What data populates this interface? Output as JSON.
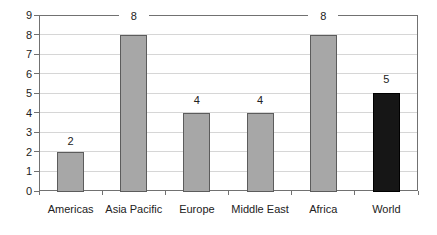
{
  "chart_data": {
    "type": "bar",
    "title": "",
    "xlabel": "",
    "ylabel": "",
    "categories": [
      "Americas",
      "Asia Pacific",
      "Europe",
      "Middle East",
      "Africa",
      "World"
    ],
    "values": [
      2,
      8,
      4,
      4,
      8,
      5
    ],
    "data_labels": [
      "2",
      "8",
      "4",
      "4",
      "8",
      "5"
    ],
    "bar_fills": [
      "#a7a7a7",
      "#a7a7a7",
      "#a7a7a7",
      "#a7a7a7",
      "#a7a7a7",
      "#161616"
    ],
    "bar_borders": [
      "#5c5c5c",
      "#5c5c5c",
      "#5c5c5c",
      "#5c5c5c",
      "#5c5c5c",
      "#000000"
    ],
    "highlighted_category": "World",
    "ylim": [
      0,
      9
    ],
    "ytick_labels": [
      "0",
      "1",
      "2",
      "3",
      "4",
      "5",
      "6",
      "7",
      "8",
      "9"
    ],
    "grid": true,
    "legend": "none"
  },
  "style": {
    "background": "#ffffff",
    "axis_color": "#717171",
    "gridline_color": "#d6d6d6",
    "text_color": "#222222"
  }
}
